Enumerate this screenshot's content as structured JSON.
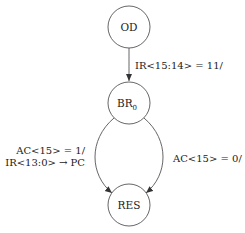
{
  "diagram": {
    "type": "state-diagram",
    "colors": {
      "stroke": "#555555",
      "text": "#222222",
      "background": "#ffffff"
    },
    "nodes": [
      {
        "id": "OD",
        "label": "OD",
        "sub": ""
      },
      {
        "id": "BR0",
        "label": "BR",
        "sub": "0"
      },
      {
        "id": "RES",
        "label": "RES",
        "sub": ""
      }
    ],
    "edges": [
      {
        "from": "OD",
        "to": "BR0",
        "label": "IR<15:14> = 11/"
      },
      {
        "from": "BR0",
        "to": "RES",
        "label_line1": "AC<15> = 1/",
        "label_line2": "IR<13:0> → PC"
      },
      {
        "from": "BR0",
        "to": "RES",
        "label": "AC<15> = 0/"
      }
    ]
  }
}
